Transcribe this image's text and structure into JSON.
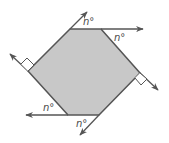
{
  "diagram": {
    "type": "hexagon-exterior-angles",
    "colors": {
      "fill": "#c8c8c8",
      "stroke": "#555555",
      "background": "#ffffff"
    },
    "labels": {
      "angle_top_left": "n°",
      "angle_top_right": "n°",
      "angle_bottom_left": "n°",
      "angle_bottom_right": "n°"
    },
    "right_angle_markers": [
      "left",
      "right"
    ]
  }
}
